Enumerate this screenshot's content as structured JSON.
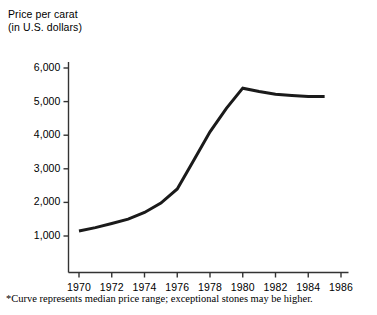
{
  "chart_data": {
    "type": "line",
    "title": "Price per carat",
    "subtitle": "(in U.S. dollars)",
    "xlabel": "",
    "ylabel": "Price per carat (in U.S. dollars)",
    "x": [
      1970,
      1971,
      1972,
      1973,
      1974,
      1975,
      1976,
      1977,
      1978,
      1979,
      1980,
      1981,
      1982,
      1983,
      1984,
      1985
    ],
    "values": [
      1150,
      1250,
      1370,
      1500,
      1700,
      1980,
      2400,
      3250,
      4100,
      4800,
      5400,
      5300,
      5220,
      5180,
      5150,
      5150
    ],
    "series": [
      {
        "name": "Median price per carat",
        "values": [
          1150,
          1250,
          1370,
          1500,
          1700,
          1980,
          2400,
          3250,
          4100,
          4800,
          5400,
          5300,
          5220,
          5180,
          5150,
          5150
        ]
      }
    ],
    "xlim": [
      1969,
      1986.6
    ],
    "ylim": [
      0,
      6300
    ],
    "xticks": [
      1970,
      1972,
      1974,
      1976,
      1978,
      1980,
      1982,
      1984,
      1986
    ],
    "xtick_labels": [
      "1970",
      "1972",
      "1974",
      "1976",
      "1978",
      "1980",
      "1982",
      "1984",
      "1986"
    ],
    "yticks": [
      1000,
      2000,
      3000,
      4000,
      5000,
      6000
    ],
    "ytick_labels": [
      "1,000",
      "2,000",
      "3,000",
      "4,000",
      "5,000",
      "6,000"
    ],
    "grid": false,
    "legend": false,
    "line_color": "#1a1a1a",
    "line_width": 3,
    "axis_color": "#333333",
    "background": "#ffffff",
    "annotations": [
      "*Curve represents median price range; exceptional stones may be higher."
    ]
  },
  "footnote": "*Curve represents median price range; exceptional stones may be higher."
}
